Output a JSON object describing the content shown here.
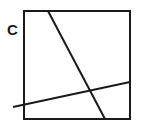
{
  "figure": {
    "label": "C",
    "label_name": "figure-label-c",
    "background_color": "#ffffff",
    "stroke_color": "#1a1a1a",
    "canvas": {
      "width": 141,
      "height": 135
    }
  },
  "square": {
    "name": "bounding-square",
    "left": 24,
    "top": 11,
    "right": 130,
    "bottom": 119,
    "width": 106,
    "height": 108,
    "stroke_width": 2,
    "fill": "none"
  },
  "lines": [
    {
      "name": "steep-diagonal-line",
      "description": "steep line from top edge down to bottom edge",
      "x1": 48,
      "y1": 11,
      "x2": 105,
      "y2": 119,
      "stroke_width": 2
    },
    {
      "name": "shallow-diagonal-line",
      "description": "shallow line from outside left of square up to right edge",
      "x1": 13,
      "y1": 107,
      "x2": 130,
      "y2": 82,
      "stroke_width": 2
    }
  ],
  "label_position": {
    "x": 7,
    "y": 35
  },
  "intersection": {
    "name": "lines-intersection-point",
    "x": 88,
    "y": 93
  }
}
